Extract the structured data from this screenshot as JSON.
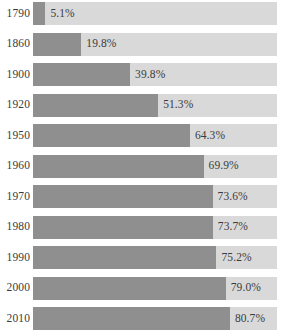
{
  "chart_data": {
    "type": "bar",
    "orientation": "horizontal",
    "title": "",
    "subtitle": "",
    "xlabel": "",
    "ylabel": "",
    "xlim": [
      0,
      100
    ],
    "grid": false,
    "legend": null,
    "value_suffix": "%",
    "categories": [
      "1790",
      "1860",
      "1900",
      "1920",
      "1950",
      "1960",
      "1970",
      "1980",
      "1990",
      "2000",
      "2010"
    ],
    "values": [
      5.1,
      19.8,
      39.8,
      51.3,
      64.3,
      69.9,
      73.6,
      73.7,
      75.2,
      79.0,
      80.7
    ],
    "value_labels": [
      "5.1%",
      "19.8%",
      "39.8%",
      "51.3%",
      "64.3%",
      "69.9%",
      "73.6%",
      "73.7%",
      "75.2%",
      "79.0%",
      "80.7%"
    ],
    "colors": {
      "bar": "#8f8f8f",
      "track": "#d9d9d9",
      "background": "#ffffff",
      "text": "#3b3b3b"
    },
    "rows": [
      {
        "label": "1790",
        "value": 5.1,
        "value_label": "5.1%"
      },
      {
        "label": "1860",
        "value": 19.8,
        "value_label": "19.8%"
      },
      {
        "label": "1900",
        "value": 39.8,
        "value_label": "39.8%"
      },
      {
        "label": "1920",
        "value": 51.3,
        "value_label": "51.3%"
      },
      {
        "label": "1950",
        "value": 64.3,
        "value_label": "64.3%"
      },
      {
        "label": "1960",
        "value": 69.9,
        "value_label": "69.9%"
      },
      {
        "label": "1970",
        "value": 73.6,
        "value_label": "73.6%"
      },
      {
        "label": "1980",
        "value": 73.7,
        "value_label": "73.7%"
      },
      {
        "label": "1990",
        "value": 75.2,
        "value_label": "75.2%"
      },
      {
        "label": "2000",
        "value": 79.0,
        "value_label": "79.0%"
      },
      {
        "label": "2010",
        "value": 80.7,
        "value_label": "80.7%"
      }
    ]
  }
}
